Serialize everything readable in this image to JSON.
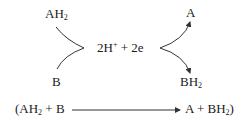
{
  "diagram": {
    "reactant_donor": {
      "base": "AH",
      "sub": "2"
    },
    "reactant_acceptor": {
      "base": "B"
    },
    "intermediate": {
      "protons": "2H",
      "proton_charge": "+",
      "plus": " + ",
      "electrons": "2e"
    },
    "product_oxidized": {
      "base": "A"
    },
    "product_reduced": {
      "base": "BH",
      "sub": "2"
    },
    "overall_equation": {
      "open": "(AH",
      "sub1": "2",
      "lhs_rest": " + B",
      "rhs_start": "A + BH",
      "sub2": "2",
      "close": ")"
    },
    "colors": {
      "text": "#1a1a1a",
      "lines": "#333333"
    }
  }
}
